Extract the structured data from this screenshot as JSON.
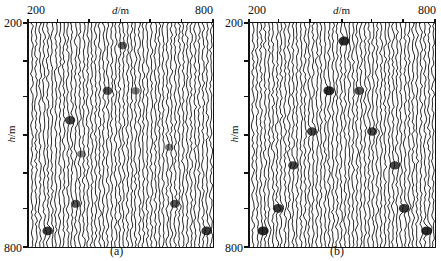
{
  "figure": {
    "panels": [
      {
        "id": "a",
        "caption": "(a)",
        "x_axis": {
          "title_var": "d",
          "title_unit": "/m",
          "min_label": "200",
          "max_label": "800"
        },
        "y_axis": {
          "title_var": "h",
          "title_unit": "/m",
          "min_label": "200",
          "max_label": "800"
        },
        "events": [
          {
            "fx": 0.5,
            "fy": 0.1,
            "s": 0.6
          },
          {
            "fx": 0.42,
            "fy": 0.3,
            "s": 0.7
          },
          {
            "fx": 0.57,
            "fy": 0.3,
            "s": 0.4
          },
          {
            "fx": 0.22,
            "fy": 0.43,
            "s": 0.8
          },
          {
            "fx": 0.28,
            "fy": 0.58,
            "s": 0.35
          },
          {
            "fx": 0.75,
            "fy": 0.55,
            "s": 0.35
          },
          {
            "fx": 0.25,
            "fy": 0.8,
            "s": 0.7
          },
          {
            "fx": 0.78,
            "fy": 0.8,
            "s": 0.7
          },
          {
            "fx": 0.1,
            "fy": 0.92,
            "s": 0.9
          },
          {
            "fx": 0.95,
            "fy": 0.92,
            "s": 0.9
          }
        ]
      },
      {
        "id": "b",
        "caption": "(b)",
        "x_axis": {
          "title_var": "d",
          "title_unit": "/m",
          "min_label": "200",
          "max_label": "800"
        },
        "y_axis": {
          "title_var": "h",
          "title_unit": "/m",
          "min_label": "200",
          "max_label": "800"
        },
        "events": [
          {
            "fx": 0.5,
            "fy": 0.08,
            "s": 1.0
          },
          {
            "fx": 0.42,
            "fy": 0.3,
            "s": 1.0
          },
          {
            "fx": 0.58,
            "fy": 0.3,
            "s": 0.7
          },
          {
            "fx": 0.33,
            "fy": 0.48,
            "s": 0.8
          },
          {
            "fx": 0.65,
            "fy": 0.48,
            "s": 0.8
          },
          {
            "fx": 0.23,
            "fy": 0.63,
            "s": 0.8
          },
          {
            "fx": 0.77,
            "fy": 0.63,
            "s": 0.8
          },
          {
            "fx": 0.15,
            "fy": 0.82,
            "s": 0.9
          },
          {
            "fx": 0.82,
            "fy": 0.82,
            "s": 0.9
          },
          {
            "fx": 0.07,
            "fy": 0.92,
            "s": 1.0
          },
          {
            "fx": 0.94,
            "fy": 0.92,
            "s": 1.0
          }
        ]
      }
    ],
    "trace_count": 46,
    "top_tick_fractions": [
      0.0,
      0.16,
      0.33,
      0.5,
      0.66,
      0.83,
      1.0
    ],
    "left_tick_fractions": [
      0.0,
      0.17,
      0.33,
      0.5,
      0.67,
      0.83,
      1.0
    ],
    "ink_color": "#111111"
  }
}
